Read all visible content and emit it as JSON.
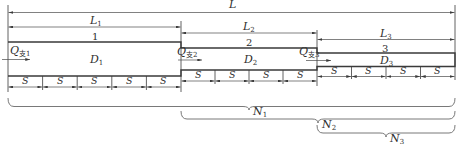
{
  "diagram": {
    "dimensions": {
      "total": {
        "main": "L",
        "sub": ""
      },
      "L1": {
        "main": "L",
        "sub": "1"
      },
      "L2": {
        "main": "L",
        "sub": "2"
      },
      "L3": {
        "main": "L",
        "sub": "3"
      }
    },
    "pipes": [
      {
        "number": "1",
        "diameter": {
          "main": "D",
          "sub": "1"
        },
        "flow": {
          "main": "Q",
          "sub": "支1"
        },
        "spacing_label": "S",
        "segments": 5
      },
      {
        "number": "2",
        "diameter": {
          "main": "D",
          "sub": "2"
        },
        "flow": {
          "main": "Q",
          "sub": "支2"
        },
        "spacing_label": "S",
        "segments": 4
      },
      {
        "number": "3",
        "diameter": {
          "main": "D",
          "sub": "3"
        },
        "flow": {
          "main": "Q",
          "sub": "支3"
        },
        "spacing_label": "S",
        "segments": 4
      }
    ],
    "braces": [
      {
        "main": "N",
        "sub": "1"
      },
      {
        "main": "N",
        "sub": "2"
      },
      {
        "main": "N",
        "sub": "3"
      }
    ],
    "colors": {
      "line": "#3a3a3a",
      "background": "#ffffff"
    }
  }
}
